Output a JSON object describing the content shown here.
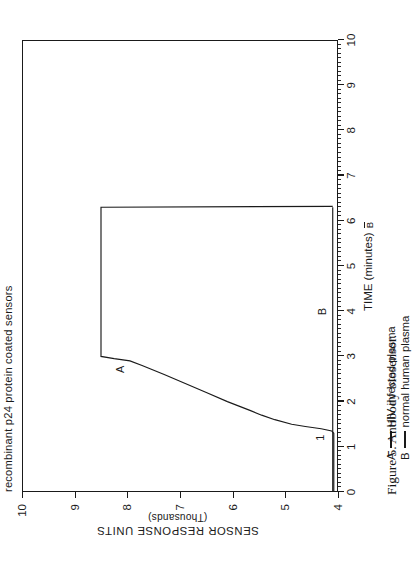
{
  "figure": {
    "caption": "Figure 5.  Antibody biosensor.",
    "plot_title": "recombinant p24 protein coated sensors"
  },
  "axes": {
    "x_title_main": "TIME",
    "x_title_unit": "(minutes)",
    "y_title_main": "SENSOR RESPONSE UNITS",
    "y_title_sub": "(Thousands)",
    "x_ticks": [
      "0",
      "1",
      "2",
      "3",
      "4",
      "5",
      "6",
      "7",
      "8",
      "9",
      "10"
    ],
    "y_ticks": [
      "4",
      "5",
      "6",
      "7",
      "8",
      "9",
      "10"
    ]
  },
  "legend": {
    "entry_a_key": "A",
    "entry_a_label": "HIV infected plasma",
    "entry_b_key": "B",
    "entry_b_label": "normal human plasma"
  },
  "annotations": {
    "curve_a": "A",
    "curve_b": "B",
    "marker_1": "1"
  },
  "colors": {
    "ink": "#1a1a1a",
    "paper": "#ffffff"
  },
  "chart_data": {
    "type": "line",
    "title": "recombinant p24 protein coated sensors",
    "xlabel": "TIME (minutes)",
    "ylabel": "SENSOR RESPONSE UNITS (Thousands)",
    "xlim": [
      0,
      10
    ],
    "ylim": [
      4,
      10
    ],
    "xticks": [
      0,
      1,
      2,
      3,
      4,
      5,
      6,
      7,
      8,
      9,
      10
    ],
    "yticks": [
      4,
      5,
      6,
      7,
      8,
      9,
      10
    ],
    "grid": false,
    "legend_position": "below-axis",
    "annotations": [
      {
        "text": "A",
        "x": 2.72,
        "y": 8.12
      },
      {
        "text": "B",
        "x": 4.0,
        "y": 4.28
      },
      {
        "text": "1",
        "x": 1.22,
        "y": 4.32
      }
    ],
    "series": [
      {
        "name": "A",
        "label": "HIV infected plasma",
        "x": [
          0.0,
          0.2,
          0.4,
          0.6,
          0.8,
          1.0,
          1.2,
          1.3,
          1.35,
          1.4,
          1.45,
          1.5,
          1.6,
          1.7,
          1.8,
          1.9,
          2.0,
          2.2,
          2.4,
          2.6,
          2.8,
          2.9,
          2.95,
          3.0,
          3.5,
          4.0,
          4.5,
          5.0,
          5.5,
          6.0,
          6.25,
          6.3,
          6.32
        ],
        "y": [
          4.08,
          4.08,
          4.08,
          4.08,
          4.08,
          4.08,
          4.08,
          4.08,
          4.12,
          4.32,
          4.62,
          4.88,
          5.2,
          5.45,
          5.66,
          5.88,
          6.1,
          6.5,
          6.9,
          7.3,
          7.72,
          7.95,
          8.25,
          8.5,
          8.5,
          8.5,
          8.5,
          8.5,
          8.5,
          8.5,
          8.5,
          8.5,
          4.1
        ]
      },
      {
        "name": "B",
        "label": "normal human plasma",
        "x": [
          0.0,
          1.0,
          2.0,
          3.0,
          4.0,
          5.0,
          6.0,
          6.3
        ],
        "y": [
          4.1,
          4.1,
          4.1,
          4.1,
          4.1,
          4.1,
          4.1,
          4.1
        ]
      }
    ]
  }
}
